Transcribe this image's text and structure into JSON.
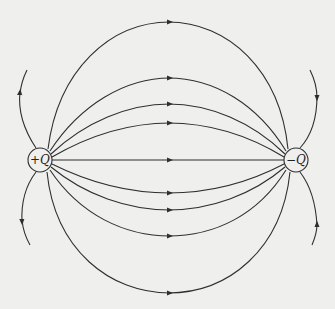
{
  "diagram": {
    "colors": {
      "background": "#efefed",
      "line": "#2f2f2f"
    },
    "charges": [
      {
        "id": "positive",
        "sign": "+",
        "symbol": "Q",
        "label": "+Q",
        "cx": 40,
        "cy": 160,
        "r": 12
      },
      {
        "id": "negative",
        "sign": "−",
        "symbol": "Q",
        "label": "−Q",
        "cx": 296,
        "cy": 160,
        "r": 12
      }
    ],
    "field_lines": {
      "connecting": [
        {
          "name": "top-outer",
          "peak_y": 22,
          "arrow": "right"
        },
        {
          "name": "top-2",
          "peak_y": 78,
          "arrow": "right"
        },
        {
          "name": "top-3",
          "peak_y": 104,
          "arrow": "right"
        },
        {
          "name": "top-inner",
          "peak_y": 123,
          "arrow": "right"
        },
        {
          "name": "center",
          "peak_y": 160,
          "arrow": "right"
        },
        {
          "name": "bottom-inner",
          "peak_y": 193,
          "arrow": "right"
        },
        {
          "name": "bottom-3",
          "peak_y": 210,
          "arrow": "right"
        },
        {
          "name": "bottom-2",
          "peak_y": 236,
          "arrow": "right"
        },
        {
          "name": "bottom-outer",
          "peak_y": 293,
          "arrow": "right"
        }
      ],
      "open": [
        {
          "name": "left-upper",
          "direction": "away-from-positive"
        },
        {
          "name": "left-lower",
          "direction": "away-from-positive"
        },
        {
          "name": "right-upper",
          "direction": "into-negative"
        },
        {
          "name": "right-lower",
          "direction": "into-negative"
        }
      ]
    }
  }
}
